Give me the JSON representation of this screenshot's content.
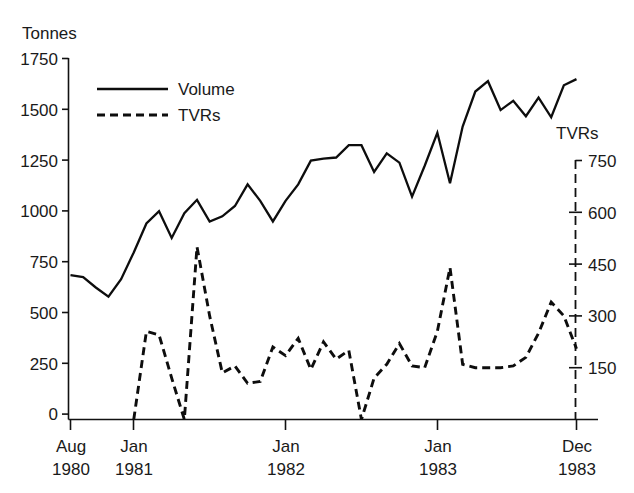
{
  "chart_data": {
    "type": "line",
    "title": "",
    "ylabel_left": "Tonnes",
    "ylabel_right": "TVRs",
    "xlabel": "",
    "grid": false,
    "legend_position": "top-left-inside",
    "y_left": {
      "ticks": [
        0,
        250,
        500,
        750,
        1000,
        1250,
        1500,
        1750
      ],
      "ylim": [
        0,
        1750
      ]
    },
    "y_right": {
      "ticks": [
        150,
        300,
        450,
        600,
        750
      ],
      "ylim": [
        0,
        800
      ]
    },
    "x_tick_labels": [
      {
        "month": "Aug",
        "year": "1980",
        "index": 0
      },
      {
        "month": "Jan",
        "year": "1981",
        "index": 5
      },
      {
        "month": "Jan",
        "year": "1982",
        "index": 17
      },
      {
        "month": "Jan",
        "year": "1983",
        "index": 29
      },
      {
        "month": "Dec",
        "year": "1983",
        "index": 40
      }
    ],
    "x": [
      "Aug 1980",
      "Sep 1980",
      "Oct 1980",
      "Nov 1980",
      "Dec 1980",
      "Jan 1981",
      "Feb 1981",
      "Mar 1981",
      "Apr 1981",
      "May 1981",
      "Jun 1981",
      "Jul 1981",
      "Aug 1981",
      "Sep 1981",
      "Oct 1981",
      "Nov 1981",
      "Dec 1981",
      "Jan 1982",
      "Feb 1982",
      "Mar 1982",
      "Apr 1982",
      "May 1982",
      "Jun 1982",
      "Jul 1982",
      "Aug 1982",
      "Sep 1982",
      "Oct 1982",
      "Nov 1982",
      "Dec 1982",
      "Jan 1983",
      "Feb 1983",
      "Mar 1983",
      "Apr 1983",
      "May 1983",
      "Jun 1983",
      "Jul 1983",
      "Aug 1983",
      "Sep 1983",
      "Oct 1983",
      "Nov 1983",
      "Dec 1983"
    ],
    "series": [
      {
        "name": "Volume",
        "axis": "left",
        "style": "solid",
        "unit": "Tonnes",
        "values": [
          700,
          690,
          640,
          595,
          680,
          810,
          950,
          1010,
          880,
          1000,
          1065,
          960,
          985,
          1035,
          1140,
          1060,
          960,
          1060,
          1140,
          1255,
          1265,
          1270,
          1330,
          1330,
          1200,
          1290,
          1245,
          1080,
          1230,
          1390,
          1145,
          1420,
          1590,
          1640,
          1500,
          1545,
          1470,
          1560,
          1465,
          1620,
          1650
        ]
      },
      {
        "name": "TVRs",
        "axis": "right",
        "style": "dashed",
        "unit": "TVRs",
        "values": [
          null,
          null,
          null,
          null,
          null,
          0,
          255,
          245,
          120,
          0,
          500,
          300,
          135,
          155,
          105,
          110,
          210,
          185,
          235,
          145,
          225,
          175,
          200,
          0,
          120,
          160,
          220,
          155,
          150,
          255,
          440,
          160,
          150,
          150,
          150,
          155,
          180,
          250,
          340,
          300,
          205
        ]
      }
    ],
    "legend": [
      {
        "label": "Volume",
        "style": "solid"
      },
      {
        "label": "TVRs",
        "style": "dashed"
      }
    ]
  },
  "labels": {
    "left_axis_title": "Tonnes",
    "right_axis_title": "TVRs",
    "tick_1750": "1750",
    "tick_1500": "1500",
    "tick_1250": "1250",
    "tick_1000": "1000",
    "tick_750": "750",
    "tick_500": "500",
    "tick_250": "250",
    "tick_0": "0",
    "rtick_750": "750",
    "rtick_600": "600",
    "rtick_450": "450",
    "rtick_300": "300",
    "rtick_150": "150",
    "x1_month": "Aug",
    "x1_year": "1980",
    "x2_month": "Jan",
    "x2_year": "1981",
    "x3_month": "Jan",
    "x3_year": "1982",
    "x4_month": "Jan",
    "x4_year": "1983",
    "x5_month": "Dec",
    "x5_year": "1983",
    "legend_volume": "Volume",
    "legend_tvrs": "TVRs"
  },
  "colors": {
    "ink": "#0d0d0d",
    "background": "#ffffff"
  }
}
